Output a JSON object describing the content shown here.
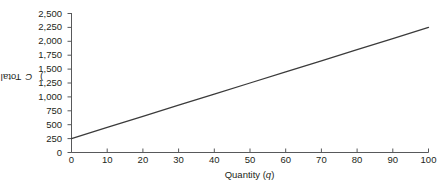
{
  "chart_data": {
    "type": "line",
    "title": "",
    "subtitle": "",
    "xlabel": "Quantity (q)",
    "ylabel": "Total cost (C)",
    "xlim": [
      0,
      100
    ],
    "ylim": [
      0,
      2500
    ],
    "grid": false,
    "legend": null,
    "legend_position": "none",
    "x_ticks": [
      0,
      10,
      20,
      30,
      40,
      50,
      60,
      70,
      80,
      90,
      100
    ],
    "x_tick_labels": [
      "0",
      "10",
      "20",
      "30",
      "40",
      "50",
      "60",
      "70",
      "80",
      "90",
      "100"
    ],
    "y_ticks": [
      0,
      250,
      500,
      750,
      1000,
      1250,
      1500,
      1750,
      2000,
      2250,
      2500
    ],
    "y_tick_labels": [
      "0",
      "250",
      "500",
      "750",
      "1,000",
      "1,250",
      "1,500",
      "1,750",
      "2,000",
      "2,250",
      "2,500"
    ],
    "series": [
      {
        "name": "Total cost",
        "color": "#3b3b3b",
        "x": [
          0,
          10,
          20,
          30,
          40,
          50,
          60,
          70,
          80,
          90,
          100
        ],
        "values": [
          250,
          450,
          650,
          850,
          1050,
          1250,
          1450,
          1650,
          1850,
          2050,
          2250
        ]
      }
    ],
    "annotations": []
  },
  "axes": {
    "y_title_main": "Total cost (",
    "y_title_var": "C",
    "y_title_close": ")",
    "x_title_main": "Quantity (",
    "x_title_var": "q",
    "x_title_close": ")"
  },
  "colors": {
    "background": "#ffffff",
    "axis": "#58595b",
    "text": "#231f20",
    "line": "#3b3b3b"
  }
}
